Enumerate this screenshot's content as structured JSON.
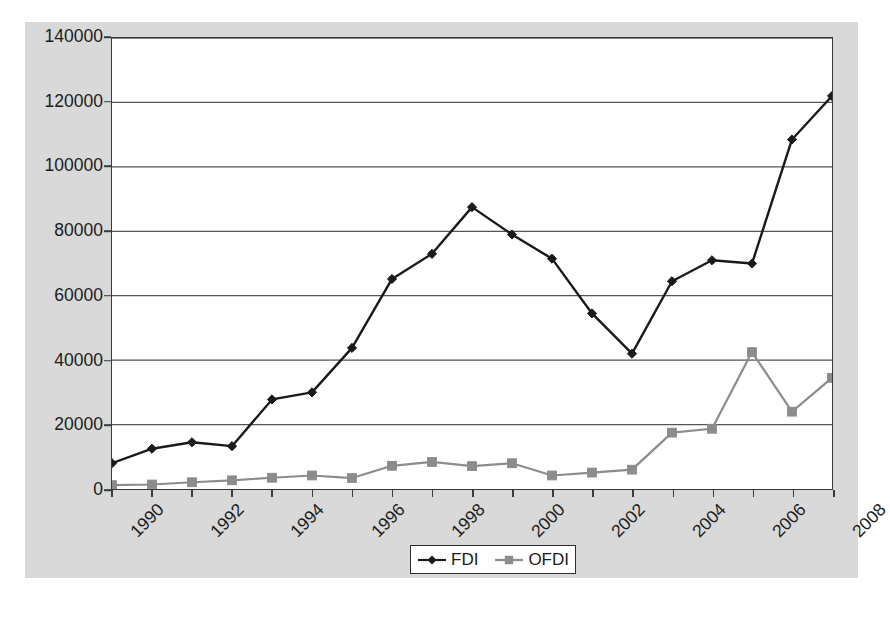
{
  "chart_data": {
    "type": "line",
    "title": "",
    "xlabel": "",
    "ylabel": "",
    "x": [
      1990,
      1991,
      1992,
      1993,
      1994,
      1995,
      1996,
      1997,
      1998,
      1999,
      2000,
      2001,
      2002,
      2003,
      2004,
      2005,
      2006,
      2007,
      2008
    ],
    "categories": [
      "1990",
      "1991",
      "1992",
      "1993",
      "1994",
      "1995",
      "1996",
      "1997",
      "1998",
      "1999",
      "2000",
      "2001",
      "2002",
      "2003",
      "2004",
      "2005",
      "2006",
      "2007",
      "2008"
    ],
    "series": [
      {
        "name": "FDI",
        "color": "#1a1a1a",
        "marker": "diamond",
        "values": [
          8000,
          12500,
          14500,
          13300,
          27800,
          30000,
          43800,
          65200,
          73000,
          87500,
          79000,
          71500,
          54500,
          42000,
          64500,
          71000,
          70000,
          108500,
          122000
        ]
      },
      {
        "name": "OFDI",
        "color": "#8c8c8c",
        "marker": "square",
        "values": [
          1200,
          1400,
          2100,
          2700,
          3500,
          4200,
          3400,
          7200,
          8400,
          7100,
          8000,
          4200,
          5100,
          6000,
          17500,
          18700,
          42500,
          24000,
          34500
        ]
      }
    ],
    "ylim": [
      0,
      140000
    ],
    "yticks": [
      0,
      20000,
      40000,
      60000,
      80000,
      100000,
      120000,
      140000
    ],
    "ytick_labels": [
      "0",
      "20000",
      "40000",
      "60000",
      "80000",
      "100000",
      "120000",
      "140000"
    ],
    "xtick_labels": [
      "1990",
      "1992",
      "1994",
      "1996",
      "1998",
      "2000",
      "2002",
      "2004",
      "2006",
      "2008"
    ],
    "xtick_values": [
      1990,
      1992,
      1994,
      1996,
      1998,
      2000,
      2002,
      2004,
      2006,
      2008
    ],
    "grid": "horizontal",
    "legend_position": "bottom-center",
    "legend_entries": [
      "FDI",
      "OFDI"
    ],
    "panel_background": "#d9d9d9",
    "plot_background": "#ffffff",
    "gridline_color": "#555555",
    "axis_color": "#3a3a3a"
  }
}
